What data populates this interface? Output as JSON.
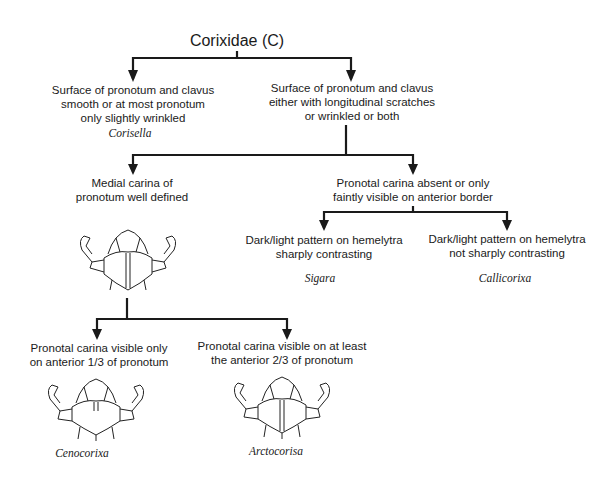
{
  "title": "Corixidae (C)",
  "nodes": {
    "n1": {
      "text": [
        "Surface of pronotum and clavus",
        "smooth or at most pronotum",
        "only slightly wrinkled"
      ],
      "genus": "Corisella"
    },
    "n2": {
      "text": [
        "Surface of pronotum and clavus",
        "either with longitudinal scratches",
        "or wrinkled or both"
      ]
    },
    "n3": {
      "text": [
        "Medial carina of",
        "pronotum well defined"
      ],
      "figure": "corixid-head-pronotum-full-carina"
    },
    "n4": {
      "text": [
        "Pronotal carina absent or only",
        "faintly visible on anterior border"
      ]
    },
    "n5": {
      "text": [
        "Dark/light pattern on hemelytra",
        "sharply contrasting"
      ],
      "genus": "Sigara"
    },
    "n6": {
      "text": [
        "Dark/light pattern on hemelytra",
        "not sharply contrasting"
      ],
      "genus": "Callicorixa"
    },
    "n7": {
      "text": [
        "Pronotal carina visible only",
        "on anterior 1/3 of pronotum"
      ],
      "genus": "Cenocorixa",
      "figure": "corixid-head-pronotum-short-carina"
    },
    "n8": {
      "text": [
        "Pronotal carina visible on at least",
        "the anterior 2/3 of pronotum"
      ],
      "genus": "Arctocorisa",
      "figure": "corixid-head-pronotum-long-carina"
    }
  },
  "colors": {
    "line": "#1a1a1a",
    "background": "#ffffff"
  }
}
